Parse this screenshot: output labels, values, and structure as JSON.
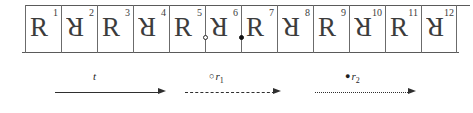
{
  "figure": {
    "strip": {
      "cells": [
        {
          "letter": "R",
          "index": "1",
          "orientation": "upright"
        },
        {
          "letter": "R",
          "index": "2",
          "orientation": "rotated-180"
        },
        {
          "letter": "R",
          "index": "3",
          "orientation": "upright"
        },
        {
          "letter": "R",
          "index": "4",
          "orientation": "rotated-180"
        },
        {
          "letter": "R",
          "index": "5",
          "orientation": "upright"
        },
        {
          "letter": "R",
          "index": "6",
          "orientation": "rotated-180"
        },
        {
          "letter": "R",
          "index": "7",
          "orientation": "upright"
        },
        {
          "letter": "R",
          "index": "8",
          "orientation": "rotated-180"
        },
        {
          "letter": "R",
          "index": "9",
          "orientation": "upright"
        },
        {
          "letter": "R",
          "index": "10",
          "orientation": "rotated-180"
        },
        {
          "letter": "R",
          "index": "11",
          "orientation": "upright"
        },
        {
          "letter": "R",
          "index": "12",
          "orientation": "rotated-180"
        }
      ],
      "markers": [
        {
          "name": "open-circle-marker",
          "style": "hollow",
          "between_cells": "5-6"
        },
        {
          "name": "filled-circle-marker",
          "style": "filled",
          "between_cells": "6-7"
        }
      ]
    },
    "legend": [
      {
        "marker": "",
        "label": "t",
        "sub": "",
        "line_style": "solid"
      },
      {
        "marker": "○",
        "label": "r",
        "sub": "1",
        "line_style": "dashed"
      },
      {
        "marker": "●",
        "label": "r",
        "sub": "2",
        "line_style": "dotted"
      }
    ]
  },
  "colors": {
    "ink": "#2f2f2f",
    "rule": "#6b6b6b",
    "background": "#ffffff"
  }
}
